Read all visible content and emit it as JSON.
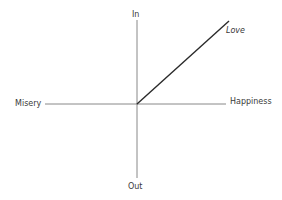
{
  "diagram": {
    "type": "quadrant-axes",
    "axes": {
      "vertical": {
        "top_label": "In",
        "bottom_label": "Out"
      },
      "horizontal": {
        "left_label": "Misery",
        "right_label": "Happiness"
      }
    },
    "lines": [
      {
        "label": "Love",
        "from": "origin",
        "direction": "In-Happiness quadrant",
        "label_style": "italic"
      }
    ],
    "colors": {
      "axis": "#6b6b6b",
      "line": "#2a2a2a",
      "text": "#3a3a3a"
    }
  }
}
